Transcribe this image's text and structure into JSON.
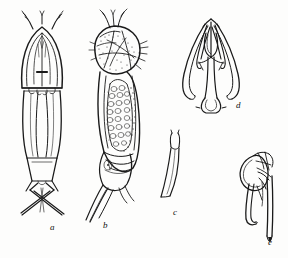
{
  "plate": {
    "kind": "scientific-line-drawing-plate",
    "subject": "copepod morphology",
    "background_color": "#fdfdfc",
    "ink_color": "#1a1a1a",
    "width": 288,
    "height": 258,
    "panel_count": 5
  },
  "panels": [
    {
      "id": "a",
      "label": "a",
      "label_x": 50,
      "label_y": 223,
      "description": "dorsal view of whole copepod body with antennae, cephalothorax, urosome and caudal rami"
    },
    {
      "id": "b",
      "label": "b",
      "label_x": 103,
      "label_y": 221,
      "description": "lateral view of whole copepod body with stippled egg mass and caudal setae"
    },
    {
      "id": "c",
      "label": "c",
      "label_x": 173,
      "label_y": 208,
      "description": "slender bifurcate appendage tip"
    },
    {
      "id": "d",
      "label": "d",
      "label_x": 236,
      "label_y": 101,
      "description": "ventral view of fifth leg pair, symmetrical with curved lateral rami"
    },
    {
      "id": "e",
      "label": "e",
      "label_x": 268,
      "label_y": 238,
      "description": "lateral view of fifth leg with swollen basal segment and elongate terminal spine"
    }
  ]
}
